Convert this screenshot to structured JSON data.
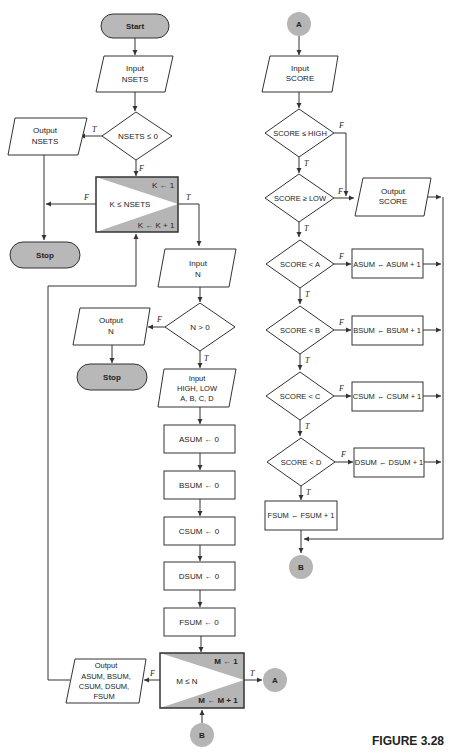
{
  "figure": {
    "caption": "FIGURE 3.28"
  },
  "left_column": {
    "start": "Start",
    "input_nsets": [
      "Input",
      "NSETS"
    ],
    "decision_nsets": "NSETS ≤ 0",
    "output_nsets": [
      "Output",
      "NSETS"
    ],
    "stop_1": "Stop",
    "loop_k": {
      "init": "K ← 1",
      "condition": "K ≤ NSETS",
      "increment": "K ← K + 1"
    },
    "input_n": [
      "Input",
      "N"
    ],
    "decision_n": "N > 0",
    "output_n": [
      "Output",
      "N"
    ],
    "stop_2": "Stop",
    "input_params": [
      "Input",
      "HIGH, LOW",
      "A, B, C, D"
    ],
    "init_steps": [
      "ASUM ← 0",
      "BSUM ← 0",
      "CSUM ← 0",
      "DSUM ← 0",
      "FSUM ← 0"
    ],
    "loop_m": {
      "init": "M ← 1",
      "condition": "M ≤ N",
      "increment": "M ← M + 1"
    },
    "output_sums": [
      "Output",
      "ASUM, BSUM,",
      "CSUM, DSUM,",
      "FSUM"
    ],
    "connector_a": "A",
    "connector_b": "B"
  },
  "right_column": {
    "connector_a": "A",
    "input_score": [
      "Input",
      "SCORE"
    ],
    "decision_high": "SCORE ≤ HIGH",
    "decision_low": "SCORE ≥ LOW",
    "output_score": [
      "Output",
      "SCORE"
    ],
    "grade_checks": [
      {
        "condition": "SCORE < A",
        "action": "ASUM ← ASUM + 1"
      },
      {
        "condition": "SCORE < B",
        "action": "BSUM ← BSUM + 1"
      },
      {
        "condition": "SCORE < C",
        "action": "CSUM ← CSUM + 1"
      },
      {
        "condition": "SCORE < D",
        "action": "DSUM ← DSUM + 1"
      }
    ],
    "fsum_action": "FSUM ← FSUM + 1",
    "connector_b": "B"
  },
  "labels": {
    "true": "T",
    "false": "F"
  }
}
